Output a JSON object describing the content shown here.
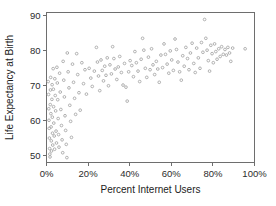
{
  "chart_data": {
    "type": "scatter",
    "title": "",
    "xlabel": "Percent Internet Users",
    "ylabel": "Life Expectancy at Birth",
    "xlim": [
      0,
      100
    ],
    "ylim": [
      48,
      91
    ],
    "xticks": [
      0,
      20,
      40,
      60,
      80,
      100
    ],
    "xtick_labels": [
      "0%",
      "20%",
      "40%",
      "60%",
      "80%",
      "100%"
    ],
    "yticks": [
      50,
      60,
      70,
      80,
      90
    ],
    "ytick_labels": [
      "50",
      "60",
      "70",
      "80",
      "90"
    ],
    "grid": false,
    "legend": null,
    "marker": "open-circle",
    "marker_color": "#a8a8a8",
    "axis_color": "#6e6e6e",
    "series": [
      {
        "name": "Countries",
        "points": [
          [
            0.8,
            71.2
          ],
          [
            1.0,
            67.5
          ],
          [
            1.1,
            63.4
          ],
          [
            1.2,
            60.1
          ],
          [
            1.3,
            57.8
          ],
          [
            1.4,
            55.0
          ],
          [
            1.5,
            52.0
          ],
          [
            1.6,
            50.4
          ],
          [
            1.7,
            49.6
          ],
          [
            1.8,
            64.6
          ],
          [
            1.9,
            68.8
          ],
          [
            2.0,
            72.4
          ],
          [
            2.1,
            62.0
          ],
          [
            2.2,
            58.2
          ],
          [
            2.3,
            54.2
          ],
          [
            2.4,
            51.3
          ],
          [
            2.6,
            66.1
          ],
          [
            2.7,
            70.3
          ],
          [
            2.8,
            61.0
          ],
          [
            2.9,
            56.4
          ],
          [
            3.0,
            53.0
          ],
          [
            3.2,
            74.9
          ],
          [
            3.3,
            69.0
          ],
          [
            3.4,
            64.0
          ],
          [
            3.5,
            59.3
          ],
          [
            3.7,
            55.6
          ],
          [
            3.9,
            51.8
          ],
          [
            4.0,
            72.0
          ],
          [
            4.2,
            67.2
          ],
          [
            4.4,
            62.8
          ],
          [
            4.6,
            57.0
          ],
          [
            4.8,
            53.6
          ],
          [
            5.0,
            75.3
          ],
          [
            5.2,
            70.8
          ],
          [
            5.4,
            66.0
          ],
          [
            5.6,
            60.6
          ],
          [
            5.8,
            56.0
          ],
          [
            6.0,
            52.4
          ],
          [
            6.3,
            73.6
          ],
          [
            6.6,
            68.2
          ],
          [
            6.9,
            63.2
          ],
          [
            7.2,
            58.6
          ],
          [
            7.5,
            54.5
          ],
          [
            7.8,
            50.8
          ],
          [
            8.0,
            77.0
          ],
          [
            8.3,
            71.6
          ],
          [
            8.6,
            66.8
          ],
          [
            8.9,
            61.4
          ],
          [
            9.2,
            57.2
          ],
          [
            9.5,
            53.2
          ],
          [
            9.8,
            49.4
          ],
          [
            10.0,
            79.4
          ],
          [
            10.4,
            74.0
          ],
          [
            10.8,
            69.4
          ],
          [
            11.2,
            64.4
          ],
          [
            11.6,
            59.8
          ],
          [
            12.0,
            55.2
          ],
          [
            12.5,
            76.2
          ],
          [
            13.0,
            71.0
          ],
          [
            13.5,
            66.4
          ],
          [
            14.0,
            61.8
          ],
          [
            14.5,
            79.2
          ],
          [
            15.0,
            73.2
          ],
          [
            15.6,
            68.0
          ],
          [
            16.2,
            63.0
          ],
          [
            17.0,
            76.6
          ],
          [
            17.8,
            70.6
          ],
          [
            18.5,
            74.6
          ],
          [
            19.2,
            67.6
          ],
          [
            20.5,
            75.0
          ],
          [
            21.3,
            72.2
          ],
          [
            22.0,
            69.8
          ],
          [
            23.0,
            74.2
          ],
          [
            24.0,
            81.0
          ],
          [
            24.5,
            76.8
          ],
          [
            25.0,
            72.8
          ],
          [
            25.6,
            68.6
          ],
          [
            26.2,
            77.4
          ],
          [
            26.8,
            74.4
          ],
          [
            27.4,
            71.4
          ],
          [
            28.0,
            75.6
          ],
          [
            28.6,
            73.0
          ],
          [
            29.2,
            78.0
          ],
          [
            29.8,
            70.0
          ],
          [
            30.5,
            76.0
          ],
          [
            31.2,
            73.4
          ],
          [
            31.8,
            81.2
          ],
          [
            32.4,
            77.8
          ],
          [
            33.0,
            74.8
          ],
          [
            33.8,
            71.8
          ],
          [
            34.5,
            75.4
          ],
          [
            35.2,
            78.4
          ],
          [
            36.0,
            73.8
          ],
          [
            36.8,
            70.2
          ],
          [
            37.5,
            76.4
          ],
          [
            38.2,
            69.6
          ],
          [
            38.8,
            65.6
          ],
          [
            39.5,
            74.0
          ],
          [
            40.2,
            77.2
          ],
          [
            41.0,
            75.8
          ],
          [
            41.8,
            72.6
          ],
          [
            42.5,
            79.8
          ],
          [
            43.2,
            76.6
          ],
          [
            44.0,
            74.2
          ],
          [
            44.8,
            71.2
          ],
          [
            45.5,
            77.6
          ],
          [
            46.2,
            83.6
          ],
          [
            46.8,
            80.2
          ],
          [
            47.5,
            75.0
          ],
          [
            48.2,
            72.4
          ],
          [
            49.0,
            78.2
          ],
          [
            49.8,
            74.6
          ],
          [
            50.5,
            80.6
          ],
          [
            51.2,
            76.0
          ],
          [
            52.0,
            73.2
          ],
          [
            52.8,
            77.0
          ],
          [
            53.5,
            74.8
          ],
          [
            54.2,
            71.0
          ],
          [
            55.0,
            78.8
          ],
          [
            55.8,
            75.2
          ],
          [
            56.5,
            82.0
          ],
          [
            57.2,
            79.0
          ],
          [
            58.0,
            76.2
          ],
          [
            58.8,
            73.6
          ],
          [
            59.5,
            80.0
          ],
          [
            60.2,
            77.4
          ],
          [
            61.0,
            74.4
          ],
          [
            61.8,
            83.4
          ],
          [
            62.5,
            80.4
          ],
          [
            63.2,
            76.8
          ],
          [
            64.0,
            74.0
          ],
          [
            64.8,
            71.6
          ],
          [
            65.5,
            78.6
          ],
          [
            66.2,
            75.6
          ],
          [
            67.0,
            81.0
          ],
          [
            67.8,
            77.8
          ],
          [
            68.5,
            74.6
          ],
          [
            69.2,
            79.4
          ],
          [
            70.0,
            82.2
          ],
          [
            70.8,
            76.4
          ],
          [
            71.5,
            73.8
          ],
          [
            72.2,
            80.8
          ],
          [
            73.0,
            78.0
          ],
          [
            73.8,
            75.0
          ],
          [
            74.5,
            82.4
          ],
          [
            75.2,
            79.6
          ],
          [
            76.0,
            89.0
          ],
          [
            76.6,
            83.6
          ],
          [
            77.2,
            80.2
          ],
          [
            77.8,
            77.2
          ],
          [
            78.4,
            74.2
          ],
          [
            79.0,
            81.6
          ],
          [
            79.6,
            79.2
          ],
          [
            80.2,
            76.6
          ],
          [
            80.8,
            82.0
          ],
          [
            81.4,
            79.8
          ],
          [
            82.0,
            77.6
          ],
          [
            82.8,
            80.6
          ],
          [
            83.5,
            78.4
          ],
          [
            84.2,
            81.2
          ],
          [
            85.0,
            79.0
          ],
          [
            85.8,
            80.4
          ],
          [
            86.5,
            78.8
          ],
          [
            87.2,
            81.0
          ],
          [
            88.0,
            79.4
          ],
          [
            88.6,
            77.0
          ],
          [
            89.5,
            80.8
          ],
          [
            95.5,
            80.6
          ]
        ]
      }
    ]
  }
}
